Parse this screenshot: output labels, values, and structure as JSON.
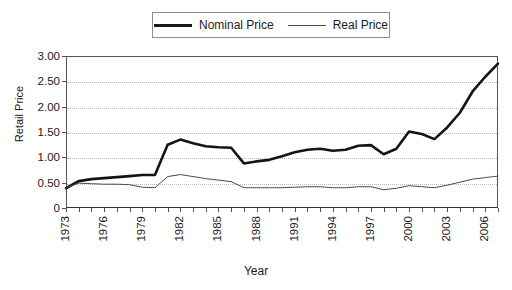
{
  "chart_data": {
    "type": "line",
    "title": "",
    "xlabel": "Year",
    "ylabel": "Retail Price",
    "xlim": [
      1973,
      2007
    ],
    "ylim": [
      0,
      3.0
    ],
    "grid": true,
    "legend_position": "top-center",
    "y_ticks": [
      "0",
      "0.50",
      "1.00",
      "1.50",
      "2.00",
      "2.50",
      "3.00"
    ],
    "y_tick_values": [
      0,
      0.5,
      1.0,
      1.5,
      2.0,
      2.5,
      3.0
    ],
    "x_tick_labels": [
      "1973",
      "1976",
      "1979",
      "1982",
      "1985",
      "1988",
      "1991",
      "1994",
      "1997",
      "2000",
      "2003",
      "2006"
    ],
    "x": [
      1973,
      1974,
      1975,
      1976,
      1977,
      1978,
      1979,
      1980,
      1981,
      1982,
      1983,
      1984,
      1985,
      1986,
      1987,
      1988,
      1989,
      1990,
      1991,
      1992,
      1993,
      1994,
      1995,
      1996,
      1997,
      1998,
      1999,
      2000,
      2001,
      2002,
      2003,
      2004,
      2005,
      2006,
      2007
    ],
    "series": [
      {
        "name": "Nominal Price",
        "color": "#141414",
        "values": [
          0.39,
          0.53,
          0.57,
          0.59,
          0.61,
          0.63,
          0.65,
          0.65,
          1.25,
          1.35,
          1.28,
          1.22,
          1.2,
          1.19,
          0.88,
          0.92,
          0.95,
          1.02,
          1.1,
          1.15,
          1.17,
          1.13,
          1.15,
          1.23,
          1.24,
          1.06,
          1.17,
          1.51,
          1.46,
          1.36,
          1.59,
          1.88,
          2.3,
          2.59,
          2.85
        ]
      },
      {
        "name": "Real Price",
        "color": "#4a4a4a",
        "values": [
          0.4,
          0.49,
          0.48,
          0.47,
          0.47,
          0.46,
          0.41,
          0.4,
          0.62,
          0.66,
          0.62,
          0.58,
          0.55,
          0.52,
          0.4,
          0.4,
          0.4,
          0.4,
          0.41,
          0.42,
          0.42,
          0.4,
          0.4,
          0.42,
          0.42,
          0.36,
          0.39,
          0.44,
          0.42,
          0.4,
          0.45,
          0.51,
          0.57,
          0.6,
          0.63
        ]
      }
    ]
  },
  "legend": {
    "entries": [
      {
        "label": "Nominal Price",
        "swatch": "thick-line-swatch"
      },
      {
        "label": "Real Price",
        "swatch": "thin-line-swatch"
      }
    ]
  },
  "axes": {
    "y_title": "Retail Price",
    "x_title": "Year"
  }
}
